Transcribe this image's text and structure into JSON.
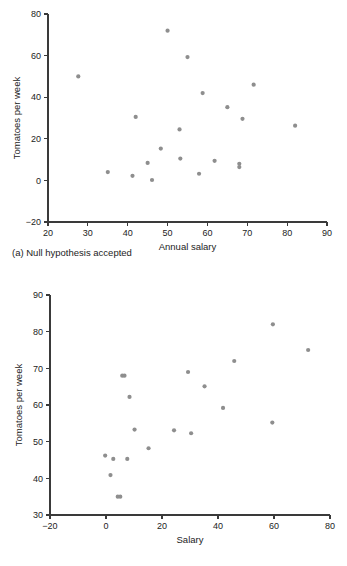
{
  "chart_data": [
    {
      "type": "scatter",
      "id": "a",
      "title": "",
      "caption": "(a) Null hypothesis accepted",
      "xlabel": "Annual salary",
      "ylabel": "Tomatoes per week",
      "xlim": [
        20,
        90
      ],
      "ylim": [
        -20,
        80
      ],
      "xticks": [
        20,
        30,
        40,
        50,
        60,
        70,
        80,
        90
      ],
      "yticks": [
        -20,
        0,
        20,
        40,
        60,
        80
      ],
      "xtick_labels": [
        "20",
        "30",
        "40",
        "50",
        "60",
        "70",
        "80",
        "90"
      ],
      "ytick_labels": [
        "-20",
        "0",
        "20",
        "40",
        "60",
        "80"
      ],
      "grid": false,
      "legend": null,
      "marker_color": "#8e8e8e",
      "points": [
        {
          "x": 27.6,
          "y": 50.0
        },
        {
          "x": 35.0,
          "y": 4.0
        },
        {
          "x": 41.2,
          "y": 2.2
        },
        {
          "x": 42.0,
          "y": 30.5
        },
        {
          "x": 45.0,
          "y": 8.4
        },
        {
          "x": 46.1,
          "y": 0.2
        },
        {
          "x": 48.3,
          "y": 15.3
        },
        {
          "x": 50.0,
          "y": 72.0
        },
        {
          "x": 53.0,
          "y": 24.5
        },
        {
          "x": 53.2,
          "y": 10.5
        },
        {
          "x": 55.0,
          "y": 59.3
        },
        {
          "x": 57.9,
          "y": 3.2
        },
        {
          "x": 58.8,
          "y": 42.0
        },
        {
          "x": 61.8,
          "y": 9.4
        },
        {
          "x": 65.0,
          "y": 35.2
        },
        {
          "x": 68.0,
          "y": 8.0
        },
        {
          "x": 68.0,
          "y": 6.4
        },
        {
          "x": 68.8,
          "y": 29.6
        },
        {
          "x": 71.6,
          "y": 46.0
        },
        {
          "x": 82.0,
          "y": 26.3
        }
      ]
    },
    {
      "type": "scatter",
      "id": "b",
      "title": "",
      "caption": "(b) Research hypothesis accepted",
      "xlabel": "Salary",
      "ylabel": "Tomatoes per week",
      "xlim": [
        -20,
        80
      ],
      "ylim": [
        30,
        90
      ],
      "xticks": [
        -20,
        0,
        20,
        40,
        60,
        80
      ],
      "yticks": [
        30,
        40,
        50,
        60,
        70,
        80,
        90
      ],
      "xtick_labels": [
        "-20",
        "0",
        "20",
        "40",
        "60",
        "80"
      ],
      "ytick_labels": [
        "30",
        "40",
        "50",
        "60",
        "70",
        "80",
        "90"
      ],
      "grid": false,
      "legend": null,
      "marker_color": "#8e8e8e",
      "points": [
        {
          "x": -0.3,
          "y": 46.2
        },
        {
          "x": 1.6,
          "y": 40.9
        },
        {
          "x": 2.6,
          "y": 45.3
        },
        {
          "x": 4.2,
          "y": 35.0
        },
        {
          "x": 5.1,
          "y": 35.0
        },
        {
          "x": 5.8,
          "y": 68.0
        },
        {
          "x": 6.6,
          "y": 68.0
        },
        {
          "x": 7.6,
          "y": 45.3
        },
        {
          "x": 8.4,
          "y": 62.2
        },
        {
          "x": 10.2,
          "y": 53.3
        },
        {
          "x": 15.2,
          "y": 48.2
        },
        {
          "x": 24.3,
          "y": 53.1
        },
        {
          "x": 29.3,
          "y": 69.0
        },
        {
          "x": 30.4,
          "y": 52.3
        },
        {
          "x": 35.2,
          "y": 65.1
        },
        {
          "x": 41.8,
          "y": 59.2
        },
        {
          "x": 45.8,
          "y": 72.0
        },
        {
          "x": 59.6,
          "y": 82.0
        },
        {
          "x": 59.4,
          "y": 55.2
        },
        {
          "x": 72.2,
          "y": 75.0
        }
      ]
    }
  ]
}
